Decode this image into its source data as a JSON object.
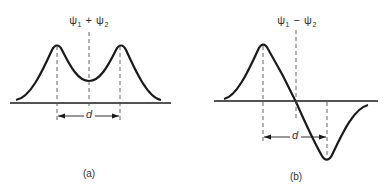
{
  "panels": [
    {
      "id": "a",
      "caption": "(a)",
      "label": {
        "psi": "ψ",
        "sub1": "1",
        "op": "+",
        "sub2": "2"
      },
      "distance_label": "d",
      "description": "Symmetric combination: two equal positive peaks with a positive minimum midway"
    },
    {
      "id": "b",
      "caption": "(b)",
      "label": {
        "psi": "ψ",
        "sub1": "1",
        "op": "−",
        "sub2": "2"
      },
      "distance_label": "d",
      "description": "Antisymmetric combination: positive peak, node at center, negative trough"
    }
  ],
  "colors": {
    "stroke": "#1a1a1a",
    "dashed": "#555555",
    "text": "#333333"
  }
}
